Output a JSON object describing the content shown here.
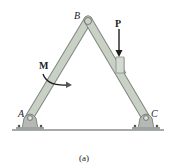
{
  "figure": {
    "caption": "(a)",
    "labels": {
      "A": "A",
      "B": "B",
      "C": "C",
      "force": "P",
      "moment": "M"
    },
    "colors": {
      "member_fill": "#c9d0c6",
      "member_stroke": "#7f877d",
      "support_fill": "#b4b9b3",
      "ground": "#8a8f8a",
      "arrow": "#1e1e1e"
    }
  }
}
